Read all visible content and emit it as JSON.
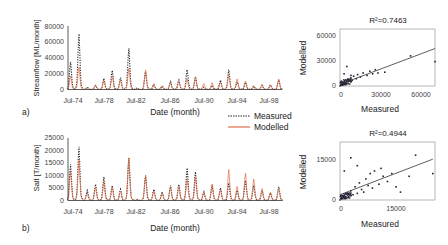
{
  "chart_data": [
    {
      "id": "a-timeseries",
      "type": "line",
      "panel_label": "a)",
      "xlabel": "Date (month)",
      "ylabel": "Streamflow [ML/month]",
      "ylim": [
        0,
        80000
      ],
      "yticks": [
        "0",
        "20000",
        "40000",
        "60000",
        "80000"
      ],
      "xticks": [
        "Jul-74",
        "Jul-78",
        "Jul-82",
        "Jul-86",
        "Jul-90",
        "Jul-94",
        "Jul-98"
      ],
      "x": [
        1974.5,
        1975.5,
        1976.5,
        1977.5,
        1978.5,
        1979.5,
        1980.5,
        1981.5,
        1982.5,
        1983.5,
        1984.5,
        1985.5,
        1986.5,
        1987.5,
        1988.5,
        1989.5,
        1990.5,
        1991.5,
        1992.5,
        1993.5,
        1994.5,
        1995.5,
        1996.5,
        1997.5,
        1998.5,
        1999.5
      ],
      "series": [
        {
          "name": "Measured",
          "style": "dotted",
          "color": "#222222",
          "values": [
            35000,
            70000,
            3000,
            5000,
            14000,
            24000,
            15000,
            52000,
            2000,
            22000,
            6000,
            4000,
            10000,
            12000,
            25000,
            16000,
            3000,
            5000,
            12000,
            25000,
            10000,
            9000,
            4000,
            5000,
            6000,
            12000
          ]
        },
        {
          "name": "Modelled",
          "style": "solid",
          "color": "#e0704a",
          "values": [
            18000,
            30000,
            2000,
            6000,
            12000,
            18000,
            12000,
            28000,
            1500,
            26000,
            8000,
            5000,
            9000,
            11000,
            14000,
            17000,
            8000,
            9000,
            10000,
            20000,
            14000,
            11000,
            5000,
            7000,
            6000,
            14000
          ]
        }
      ],
      "legend": {
        "position": "bottom-right",
        "entries": [
          "Measured",
          "Modelled"
        ]
      }
    },
    {
      "id": "a-scatter",
      "type": "scatter",
      "xlabel": "Measured",
      "ylabel": "Modelled",
      "annotation": "R²=0.7463",
      "xlim": [
        0,
        70000
      ],
      "ylim": [
        0,
        70000
      ],
      "xticks": [
        "0",
        "30000",
        "60000"
      ],
      "yticks": [
        "0",
        "30000",
        "60000"
      ],
      "trendline": {
        "x0": 0,
        "y0": 2000,
        "x1": 70000,
        "y1": 46000
      },
      "points": [
        [
          500,
          800
        ],
        [
          1000,
          1500
        ],
        [
          1500,
          3000
        ],
        [
          2000,
          1000
        ],
        [
          2500,
          4000
        ],
        [
          3000,
          2500
        ],
        [
          3500,
          6000
        ],
        [
          4000,
          3500
        ],
        [
          5000,
          5000
        ],
        [
          6000,
          8000
        ],
        [
          7000,
          6500
        ],
        [
          8000,
          10000
        ],
        [
          9000,
          7000
        ],
        [
          10000,
          12000
        ],
        [
          12000,
          9000
        ],
        [
          13000,
          14000
        ],
        [
          15000,
          11000
        ],
        [
          17000,
          16000
        ],
        [
          20000,
          13000
        ],
        [
          22000,
          18000
        ],
        [
          24000,
          15000
        ],
        [
          26000,
          20000
        ],
        [
          28000,
          16000
        ],
        [
          33000,
          17000
        ],
        [
          5000,
          24000
        ],
        [
          3000,
          15000
        ],
        [
          8000,
          13000
        ],
        [
          52000,
          37000
        ],
        [
          70000,
          30000
        ]
      ]
    },
    {
      "id": "b-timeseries",
      "type": "line",
      "panel_label": "b)",
      "xlabel": "Date (month)",
      "ylabel": "Salt [T/month]",
      "ylim": [
        0,
        25000
      ],
      "yticks": [
        "0",
        "5000",
        "10000",
        "15000",
        "20000",
        "25000"
      ],
      "xticks": [
        "Jul-74",
        "Jul-78",
        "Jul-82",
        "Jul-86",
        "Jul-90",
        "Jul-94",
        "Jul-98"
      ],
      "x": [
        1974.5,
        1975.5,
        1976.5,
        1977.5,
        1978.5,
        1979.5,
        1980.5,
        1981.5,
        1982.5,
        1983.5,
        1984.5,
        1985.5,
        1986.5,
        1987.5,
        1988.5,
        1989.5,
        1990.5,
        1991.5,
        1992.5,
        1993.5,
        1994.5,
        1995.5,
        1996.5,
        1997.5,
        1998.5,
        1999.5
      ],
      "series": [
        {
          "name": "Measured",
          "style": "dotted",
          "color": "#222222",
          "values": [
            14500,
            21500,
            4000,
            6500,
            9500,
            6000,
            4500,
            17000,
            500,
            10000,
            4500,
            3500,
            6000,
            6500,
            13000,
            11500,
            3500,
            6000,
            5000,
            7000,
            4000,
            8000,
            6000,
            4000,
            3000,
            5500
          ]
        },
        {
          "name": "Modelled",
          "style": "solid",
          "color": "#e0704a",
          "values": [
            12000,
            17000,
            3000,
            5500,
            8000,
            5500,
            4000,
            18000,
            400,
            10500,
            4000,
            3000,
            5500,
            6000,
            9000,
            10000,
            3500,
            7000,
            4500,
            13000,
            6000,
            11500,
            9000,
            5000,
            3500,
            5000
          ]
        }
      ],
      "legend": {
        "position": "top-right",
        "entries": [
          "Measured",
          "Modelled"
        ]
      }
    },
    {
      "id": "b-scatter",
      "type": "scatter",
      "xlabel": "Measured",
      "ylabel": "Modelled",
      "annotation": "R²=0.4944",
      "xlim": [
        0,
        22000
      ],
      "ylim": [
        0,
        22000
      ],
      "xticks": [
        "0",
        "15000"
      ],
      "yticks": [
        "0",
        "15000"
      ],
      "trendline": {
        "x0": 0,
        "y0": 2000,
        "x1": 21500,
        "y1": 15500
      },
      "points": [
        [
          300,
          500
        ],
        [
          800,
          1500
        ],
        [
          1200,
          800
        ],
        [
          1500,
          2500
        ],
        [
          2000,
          1200
        ],
        [
          2500,
          3500
        ],
        [
          3000,
          2000
        ],
        [
          3500,
          5000
        ],
        [
          4000,
          2500
        ],
        [
          4500,
          6500
        ],
        [
          5000,
          4000
        ],
        [
          5500,
          3000
        ],
        [
          6000,
          8000
        ],
        [
          6500,
          5500
        ],
        [
          7000,
          10000
        ],
        [
          7500,
          4500
        ],
        [
          8000,
          11000
        ],
        [
          9000,
          6000
        ],
        [
          10000,
          9000
        ],
        [
          11000,
          7000
        ],
        [
          12000,
          10000
        ],
        [
          13000,
          5000
        ],
        [
          14000,
          3000
        ],
        [
          16000,
          9000
        ],
        [
          17500,
          17000
        ],
        [
          21500,
          10000
        ],
        [
          2500,
          16000
        ],
        [
          1000,
          11000
        ],
        [
          4000,
          13000
        ],
        [
          9500,
          12000
        ]
      ]
    }
  ],
  "panels": {
    "a": {
      "label": "a)",
      "ts_ylabel": "Streamflow [ML/month]",
      "ts_xlabel": "Date (month)",
      "sc_xlabel": "Measured",
      "sc_ylabel": "Modelled",
      "r2": "R²=0.7463",
      "ts_yticks": [
        "0",
        "20000",
        "40000",
        "60000",
        "80000"
      ],
      "sc_xticks": [
        "0",
        "30000",
        "60000"
      ],
      "sc_yticks": [
        "0",
        "30000",
        "60000"
      ]
    },
    "b": {
      "label": "b)",
      "ts_ylabel": "Salt [T/month]",
      "ts_xlabel": "Date (month)",
      "sc_xlabel": "Measured",
      "sc_ylabel": "Modelled",
      "r2": "R²=0.4944",
      "ts_yticks": [
        "0",
        "5000",
        "10000",
        "15000",
        "20000",
        "25000"
      ],
      "sc_xticks": [
        "0",
        "15000"
      ],
      "sc_yticks": [
        "0",
        "15000"
      ]
    }
  },
  "xticks": [
    "Jul-74",
    "Jul-78",
    "Jul-82",
    "Jul-86",
    "Jul-90",
    "Jul-94",
    "Jul-98"
  ],
  "legend": {
    "measured": "Measured",
    "modelled": "Modelled"
  },
  "colors": {
    "measured": "#222222",
    "modelled": "#e0704a",
    "axis": "#333333"
  }
}
